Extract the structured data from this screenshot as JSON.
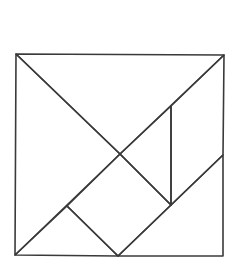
{
  "diagram": {
    "type": "tangram",
    "canvas": {
      "width": 237,
      "height": 275,
      "background": "#ffffff"
    },
    "stroke_color": "#3a3a3a",
    "outer_square": {
      "x1": 16,
      "y1": 54,
      "x2": 224,
      "y2": 256
    },
    "points": {
      "top_left": [
        16,
        54
      ],
      "top_right": [
        224,
        55
      ],
      "bottom_left": [
        15,
        255
      ],
      "bottom_right": [
        223,
        256
      ],
      "center": [
        120,
        154
      ],
      "bottom_mid": [
        118,
        256
      ],
      "diag_mid_upper": [
        171,
        106
      ],
      "diag_mid_lower": [
        171,
        205
      ],
      "right_mid": [
        223,
        155
      ],
      "square_left": [
        67,
        206
      ]
    },
    "pieces": [
      {
        "name": "large-triangle-top",
        "points": [
          [
            16,
            54
          ],
          [
            224,
            55
          ],
          [
            120,
            154
          ]
        ]
      },
      {
        "name": "large-triangle-left",
        "points": [
          [
            16,
            54
          ],
          [
            120,
            154
          ],
          [
            15,
            255
          ]
        ]
      },
      {
        "name": "medium-triangle-bottom-right",
        "points": [
          [
            118,
            256
          ],
          [
            223,
            155
          ],
          [
            223,
            256
          ]
        ]
      },
      {
        "name": "small-triangle-bottom-left",
        "points": [
          [
            15,
            255
          ],
          [
            67,
            206
          ],
          [
            118,
            256
          ]
        ]
      },
      {
        "name": "square",
        "points": [
          [
            67,
            206
          ],
          [
            120,
            154
          ],
          [
            171,
            205
          ],
          [
            118,
            256
          ]
        ]
      },
      {
        "name": "small-triangle-center",
        "points": [
          [
            120,
            154
          ],
          [
            171,
            106
          ],
          [
            171,
            205
          ]
        ]
      },
      {
        "name": "parallelogram-right",
        "points": [
          [
            171,
            106
          ],
          [
            224,
            55
          ],
          [
            223,
            155
          ],
          [
            171,
            205
          ]
        ]
      }
    ]
  }
}
